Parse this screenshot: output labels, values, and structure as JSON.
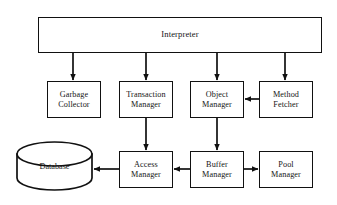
{
  "diagram": {
    "type": "block-architecture-diagram",
    "colors": {
      "stroke": "#111111",
      "fill": "#ffffff",
      "text": "#151515"
    },
    "nodes": [
      {
        "id": "interpreter",
        "label": "Interpreter",
        "lines": [
          "Interpreter"
        ],
        "shape": "rectangle",
        "x": 38,
        "y": 17,
        "w": 284,
        "h": 36
      },
      {
        "id": "garbage-collector",
        "label": "Garbage Collector",
        "lines": [
          "Garbage",
          "Collector"
        ],
        "shape": "rectangle",
        "x": 47,
        "y": 81,
        "w": 54,
        "h": 37
      },
      {
        "id": "transaction-manager",
        "label": "Transaction Manager",
        "lines": [
          "Transaction",
          "Manager"
        ],
        "shape": "rectangle",
        "x": 119,
        "y": 81,
        "w": 54,
        "h": 37
      },
      {
        "id": "object-manager",
        "label": "Object Manager",
        "lines": [
          "Object",
          "Manager"
        ],
        "shape": "rectangle",
        "x": 190,
        "y": 81,
        "w": 54,
        "h": 37
      },
      {
        "id": "method-fetcher",
        "label": "Method Fetcher",
        "lines": [
          "Method",
          "Fetcher"
        ],
        "shape": "rectangle",
        "x": 259,
        "y": 81,
        "w": 54,
        "h": 37
      },
      {
        "id": "database",
        "label": "Database",
        "lines": [
          "Database"
        ],
        "shape": "cylinder",
        "x": 17,
        "y": 142,
        "w": 75,
        "h": 48
      },
      {
        "id": "access-manager",
        "label": "Access Manager",
        "lines": [
          "Access",
          "Manager"
        ],
        "shape": "rectangle",
        "x": 119,
        "y": 151,
        "w": 54,
        "h": 37
      },
      {
        "id": "buffer-manager",
        "label": "Buffer Manager",
        "lines": [
          "Buffer",
          "Manager"
        ],
        "shape": "rectangle",
        "x": 190,
        "y": 151,
        "w": 54,
        "h": 37
      },
      {
        "id": "pool-manager",
        "label": "Pool Manager",
        "lines": [
          "Pool",
          "Manager"
        ],
        "shape": "rectangle",
        "x": 259,
        "y": 151,
        "w": 54,
        "h": 37
      }
    ],
    "edges": [
      {
        "id": "interpreter-to-garbage-collector",
        "from": "interpreter",
        "to": "garbage-collector",
        "direction": "down"
      },
      {
        "id": "interpreter-to-transaction-manager",
        "from": "interpreter",
        "to": "transaction-manager",
        "direction": "down"
      },
      {
        "id": "interpreter-to-object-manager",
        "from": "interpreter",
        "to": "object-manager",
        "direction": "down"
      },
      {
        "id": "interpreter-to-method-fetcher",
        "from": "interpreter",
        "to": "method-fetcher",
        "direction": "down"
      },
      {
        "id": "method-fetcher-to-object-manager",
        "from": "method-fetcher",
        "to": "object-manager",
        "direction": "left"
      },
      {
        "id": "transaction-manager-to-access-manager",
        "from": "transaction-manager",
        "to": "access-manager",
        "direction": "down"
      },
      {
        "id": "object-manager-to-buffer-manager",
        "from": "object-manager",
        "to": "buffer-manager",
        "direction": "down"
      },
      {
        "id": "buffer-manager-to-access-manager",
        "from": "buffer-manager",
        "to": "access-manager",
        "direction": "left"
      },
      {
        "id": "access-manager-to-database",
        "from": "access-manager",
        "to": "database",
        "direction": "left"
      },
      {
        "id": "buffer-manager-to-pool-manager",
        "from": "buffer-manager",
        "to": "pool-manager",
        "direction": "right"
      }
    ]
  }
}
